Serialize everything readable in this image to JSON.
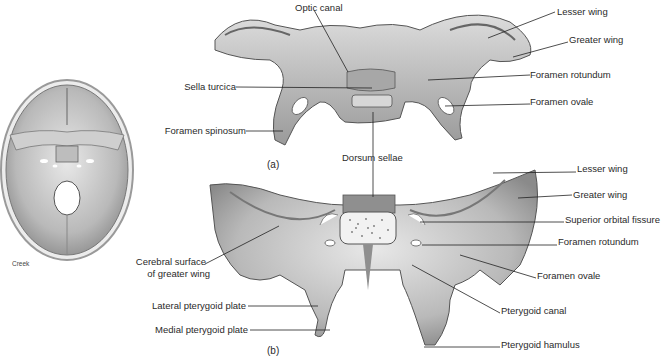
{
  "figure": {
    "credit": "Creek",
    "panels": [
      {
        "caption": "(a)",
        "view": "superior view",
        "labels": [
          {
            "id": "optic-canal",
            "text": "Optic canal"
          },
          {
            "id": "sella-turcica",
            "text": "Sella turcica"
          },
          {
            "id": "foramen-spinosum",
            "text": "Foramen spinosum"
          },
          {
            "id": "lesser-wing-a",
            "text": "Lesser wing"
          },
          {
            "id": "greater-wing-a",
            "text": "Greater wing"
          },
          {
            "id": "foramen-rotundum-a",
            "text": "Foramen rotundum"
          },
          {
            "id": "foramen-ovale-a",
            "text": "Foramen ovale"
          },
          {
            "id": "dorsum-sellae",
            "text": "Dorsum sellae"
          }
        ]
      },
      {
        "caption": "(b)",
        "view": "posterior view",
        "labels": [
          {
            "id": "lesser-wing-b",
            "text": "Lesser wing"
          },
          {
            "id": "greater-wing-b",
            "text": "Greater wing"
          },
          {
            "id": "superior-orbital-fissure",
            "text": "Superior orbital fissure"
          },
          {
            "id": "foramen-rotundum-b",
            "text": "Foramen rotundum"
          },
          {
            "id": "foramen-ovale-b",
            "text": "Foramen ovale"
          },
          {
            "id": "pterygoid-canal",
            "text": "Pterygoid canal"
          },
          {
            "id": "pterygoid-hamulus",
            "text": "Pterygoid hamulus"
          },
          {
            "id": "cerebral-surface-1",
            "text": "Cerebral surface"
          },
          {
            "id": "cerebral-surface-2",
            "text": "of greater wing"
          },
          {
            "id": "lateral-pterygoid-plate",
            "text": "Lateral pterygoid plate"
          },
          {
            "id": "medial-pterygoid-plate",
            "text": "Medial pterygoid plate"
          }
        ]
      }
    ]
  }
}
